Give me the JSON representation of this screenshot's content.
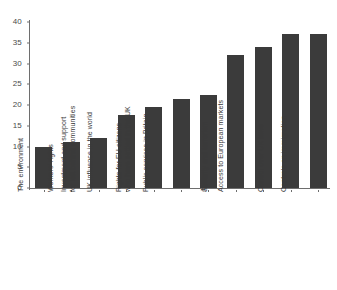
{
  "chart_data": {
    "type": "bar",
    "title": "",
    "xlabel": "",
    "ylabel": "",
    "ylim": [
      0,
      40
    ],
    "yticks": [
      0,
      5,
      10,
      15,
      20,
      25,
      30,
      35,
      40
    ],
    "grid": false,
    "legend": "none",
    "bar_color": "#3b3b3b",
    "axis_color": "#6e6e6e",
    "categories": [
      "The environment",
      "Workers' rights",
      "Investment and support for left behind communities",
      "UK influence in the world",
      "Rights for EU citizens who have settled in the UK",
      "Public services in Britain",
      "Jobs",
      "Security and terrorism",
      "Access to European markets",
      "Control over UK laws",
      "Controls on immigration"
    ],
    "category_lines": [
      [
        "The environment"
      ],
      [
        "Workers' rights"
      ],
      [
        "Investment and support",
        "for left behind communities"
      ],
      [
        "UK influence in the world"
      ],
      [
        "Rights for EU citizens",
        "who have settled in the UK"
      ],
      [
        "Public services in Britain"
      ],
      [
        "Jobs"
      ],
      [
        "Security and terrorism"
      ],
      [
        "Access to European markets"
      ],
      [
        "Control over UK laws"
      ],
      [
        "Controls on immigration"
      ]
    ],
    "values": [
      10,
      11,
      12,
      17.5,
      19.5,
      21.5,
      22.5,
      32,
      34,
      37,
      37
    ]
  }
}
